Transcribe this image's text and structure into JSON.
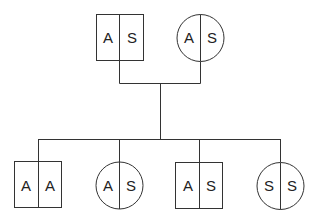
{
  "diagram": {
    "type": "pedigree",
    "parents": {
      "father": {
        "sex": "male",
        "shape": "square",
        "alleles": [
          "A",
          "S"
        ]
      },
      "mother": {
        "sex": "female",
        "shape": "circle",
        "alleles": [
          "A",
          "S"
        ]
      }
    },
    "children": [
      {
        "sex": "male",
        "shape": "square",
        "alleles": [
          "A",
          "A"
        ]
      },
      {
        "sex": "female",
        "shape": "circle",
        "alleles": [
          "A",
          "S"
        ]
      },
      {
        "sex": "male",
        "shape": "square",
        "alleles": [
          "A",
          "S"
        ]
      },
      {
        "sex": "female",
        "shape": "circle",
        "alleles": [
          "S",
          "S"
        ]
      }
    ]
  }
}
